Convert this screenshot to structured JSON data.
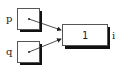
{
  "diagram": {
    "type": "pointer-diagram",
    "nodes": [
      {
        "id": "p",
        "label": "p",
        "value": "",
        "kind": "pointer",
        "points_to": "i"
      },
      {
        "id": "q",
        "label": "q",
        "value": "",
        "kind": "pointer",
        "points_to": "i"
      },
      {
        "id": "i",
        "label": "i",
        "value": "1",
        "kind": "variable"
      }
    ],
    "edges": [
      {
        "from": "p",
        "to": "i"
      },
      {
        "from": "q",
        "to": "i"
      }
    ],
    "colors": {
      "stroke": "#222222",
      "shadow": "#111111",
      "fill": "#ffffff"
    }
  }
}
